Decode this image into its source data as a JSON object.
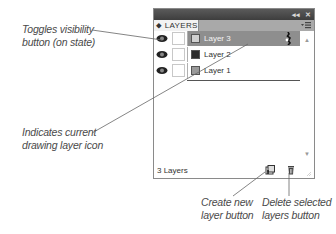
{
  "callouts": {
    "toggle_visibility": [
      "Toggles visibility",
      "button (on state)"
    ],
    "current_layer": [
      "Indicates current",
      "drawing layer icon"
    ],
    "create_layer": [
      "Create new",
      "layer button"
    ],
    "delete_layers": [
      "Delete selected",
      "layers button"
    ]
  },
  "panel": {
    "title_controls": {
      "collapse": "◂◂",
      "close": "✕"
    },
    "tab_label": "⬥ LAYERS",
    "layers": [
      {
        "name": "Layer 3",
        "swatch": "#d0d0d0",
        "active": true,
        "visible": true,
        "drawing": true
      },
      {
        "name": "Layer 2",
        "swatch": "#2c2c2c",
        "active": false,
        "visible": true,
        "drawing": false
      },
      {
        "name": "Layer 1",
        "swatch": "#9a9a9a",
        "active": false,
        "visible": true,
        "drawing": false
      }
    ],
    "footer": {
      "count": "3 Layers"
    },
    "scroll": {
      "up": "▲",
      "down": "▼"
    }
  },
  "colors": {
    "titlebar": "#4a4a4a",
    "active_row": "#8e8e8e",
    "tabrow": "#a9a9a9",
    "callout_text": "#4a4a4a"
  }
}
